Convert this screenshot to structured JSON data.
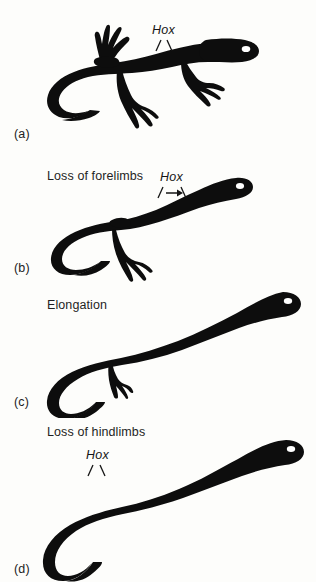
{
  "figure": {
    "background_color": "#fdfdfb",
    "silhouette_color": "#0d0d0d",
    "eye_color": "#ffffff",
    "type": "scientific-diagram"
  },
  "panels": [
    {
      "id": "a",
      "label": "(a)",
      "caption": "",
      "hox_label": "Hox",
      "marker_type": "two-ticks",
      "description": "Lizard with forelimbs and hindlimbs and a long curved tail"
    },
    {
      "id": "b",
      "label": "(b)",
      "caption": "Loss of forelimbs",
      "hox_label": "Hox",
      "marker_type": "two-ticks-with-arrow",
      "description": "Lizard-like animal lacking forelimbs, hindlimbs retained"
    },
    {
      "id": "c",
      "label": "(c)",
      "caption": "Elongation",
      "hox_label": "",
      "marker_type": "none",
      "description": "Greatly elongated trunk with only vestigial hindlimbs"
    },
    {
      "id": "d",
      "label": "(d)",
      "caption": "Loss of hindlimbs",
      "hox_label": "Hox",
      "marker_type": "two-ticks",
      "description": "Fully limbless snake-like body with tapering hooked tail"
    }
  ]
}
